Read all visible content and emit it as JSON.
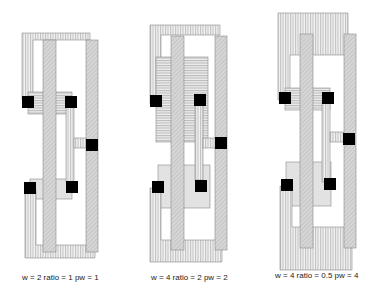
{
  "figure": {
    "colors": {
      "background": "#ffffff",
      "outline": "#8a8a8a",
      "metal_hatch": "#a8a8a8",
      "poly_fill": "#d0d0d0",
      "diffusion_fill": "#e2e2e2",
      "contact": "#000000"
    },
    "layouts": [
      {
        "id": "layout-1",
        "caption": "w = 2 ratio = 1 pw = 1"
      },
      {
        "id": "layout-2",
        "caption": "w = 4 ratio = 2 pw = 2"
      },
      {
        "id": "layout-3",
        "caption": "w = 4 ratio = 0.5 pw = 4"
      }
    ]
  }
}
